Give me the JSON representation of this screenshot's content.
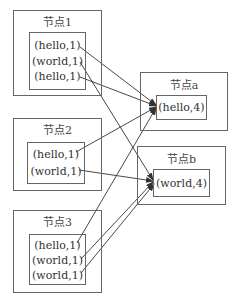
{
  "diagram": {
    "type": "mapreduce-shuffle",
    "source_nodes": [
      {
        "id": "n1",
        "label": "节点1",
        "records": [
          "(hello,1)",
          "(world,1)",
          "(hello,1)"
        ]
      },
      {
        "id": "n2",
        "label": "节点2",
        "records": [
          "(hello,1)",
          "(world,1)"
        ]
      },
      {
        "id": "n3",
        "label": "节点3",
        "records": [
          "(hello,1)",
          "(world,1)",
          "(world,1)"
        ]
      }
    ],
    "target_nodes": [
      {
        "id": "na",
        "label": "节点a",
        "records": [
          "(hello,4)"
        ]
      },
      {
        "id": "nb",
        "label": "节点b",
        "records": [
          "(world,4)"
        ]
      }
    ],
    "edges": [
      {
        "from": "n1.0",
        "to": "na"
      },
      {
        "from": "n1.1",
        "to": "nb"
      },
      {
        "from": "n1.2",
        "to": "na"
      },
      {
        "from": "n2.0",
        "to": "na"
      },
      {
        "from": "n2.1",
        "to": "nb"
      },
      {
        "from": "n3.0",
        "to": "na"
      },
      {
        "from": "n3.1",
        "to": "nb"
      },
      {
        "from": "n3.2",
        "to": "nb"
      }
    ],
    "colors": {
      "line": "#333333",
      "border": "#666666",
      "text": "#333333"
    }
  }
}
